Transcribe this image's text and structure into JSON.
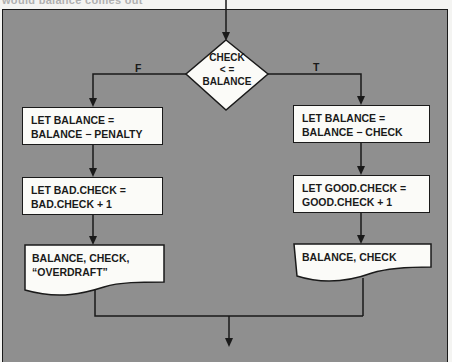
{
  "header_fragment": "would balance comes out",
  "decision": {
    "lines": [
      "CHECK",
      "< =",
      "BALANCE"
    ],
    "false_label": "F",
    "true_label": "T"
  },
  "false_branch": {
    "process_1": [
      "LET BALANCE =",
      "BALANCE − PENALTY"
    ],
    "process_2": [
      "LET BAD.CHECK =",
      "BAD.CHECK + 1"
    ],
    "output": [
      "BALANCE, CHECK,",
      "“OVERDRAFT”"
    ]
  },
  "true_branch": {
    "process_1": [
      "LET BALANCE =",
      "BALANCE − CHECK"
    ],
    "process_2": [
      "LET GOOD.CHECK =",
      "GOOD.CHECK + 1"
    ],
    "output": [
      "BALANCE, CHECK"
    ]
  },
  "colors": {
    "background_fill": "#8f8f8f",
    "box_fill": "#fbfbf8",
    "line": "#1a1a1a"
  }
}
